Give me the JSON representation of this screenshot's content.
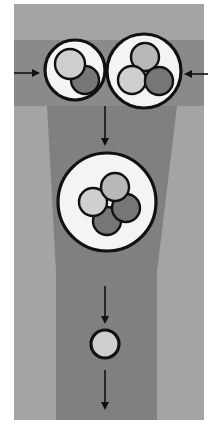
{
  "canvas": {
    "width": 211,
    "height": 426,
    "background": "#ffffff"
  },
  "colors": {
    "panel_light": "#a4a4a4",
    "band_dark": "#8a8a8a",
    "column_dark": "#808080",
    "vesicle_fill": "#f4f4f4",
    "outline": "#111111",
    "light_particle": "#cfcfcf",
    "mid_particle": "#b8b8b8",
    "dark_particle": "#767676",
    "arrow": "#111111"
  },
  "panel": {
    "x": 14,
    "y": 4,
    "w": 190,
    "h": 416
  },
  "band": {
    "x": 14,
    "y": 40,
    "w": 190,
    "h": 66
  },
  "column": {
    "points": [
      [
        47,
        106
      ],
      [
        177,
        106
      ],
      [
        157,
        272
      ],
      [
        157,
        420
      ],
      [
        56,
        420
      ],
      [
        56,
        272
      ]
    ]
  },
  "vesicles": [
    {
      "id": "small-left",
      "cx": 75,
      "cy": 70,
      "r": 30,
      "particles": [
        {
          "cx": 85,
          "cy": 80,
          "r": 14,
          "shade": "dark_particle"
        },
        {
          "cx": 70,
          "cy": 64,
          "r": 15,
          "shade": "light_particle"
        }
      ]
    },
    {
      "id": "large-right",
      "cx": 144,
      "cy": 71,
      "r": 37,
      "particles": [
        {
          "cx": 145,
          "cy": 57,
          "r": 14,
          "shade": "mid_particle"
        },
        {
          "cx": 132,
          "cy": 80,
          "r": 14,
          "shade": "light_particle"
        },
        {
          "cx": 159,
          "cy": 81,
          "r": 14,
          "shade": "dark_particle"
        }
      ]
    },
    {
      "id": "fused-middle",
      "cx": 107,
      "cy": 202,
      "r": 49,
      "particles": [
        {
          "cx": 107,
          "cy": 221,
          "r": 14,
          "shade": "dark_particle"
        },
        {
          "cx": 126,
          "cy": 208,
          "r": 14,
          "shade": "dark_particle"
        },
        {
          "cx": 93,
          "cy": 202,
          "r": 14,
          "shade": "light_particle"
        },
        {
          "cx": 115,
          "cy": 187,
          "r": 14,
          "shade": "mid_particle"
        }
      ]
    },
    {
      "id": "released-particle",
      "cx": 105,
      "cy": 344,
      "r": 14,
      "particles": [],
      "fill": "light_particle"
    }
  ],
  "arrows": [
    {
      "id": "arrow-in-left",
      "x1": 14,
      "y1": 73,
      "x2": 38,
      "y2": 73
    },
    {
      "id": "arrow-in-right",
      "x1": 208,
      "y1": 74,
      "x2": 186,
      "y2": 74
    },
    {
      "id": "arrow-down-1",
      "x1": 105,
      "y1": 106,
      "x2": 105,
      "y2": 144
    },
    {
      "id": "arrow-down-2",
      "x1": 105,
      "y1": 286,
      "x2": 105,
      "y2": 322
    },
    {
      "id": "arrow-down-3",
      "x1": 105,
      "y1": 370,
      "x2": 105,
      "y2": 408
    }
  ]
}
